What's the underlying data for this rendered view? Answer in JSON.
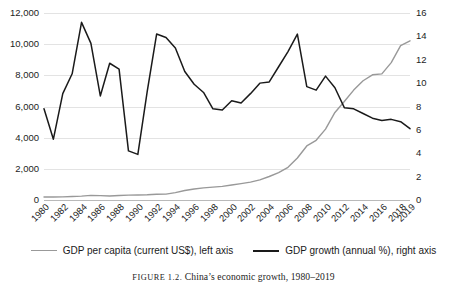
{
  "caption": {
    "prefix": "FIGURE 1.2.",
    "text": "China’s economic growth, 1980–2019"
  },
  "legend": {
    "items": [
      {
        "label": "GDP per capita (current US$), left axis",
        "color": "#999999"
      },
      {
        "label": "GDP growth (annual %), right axis",
        "color": "#1a1a1a"
      }
    ]
  },
  "chart_data": {
    "type": "line",
    "title": "China’s economic growth, 1980–2019",
    "xlabel": "",
    "grid": true,
    "legend_position": "bottom",
    "x": [
      1980,
      1981,
      1982,
      1983,
      1984,
      1985,
      1986,
      1987,
      1988,
      1989,
      1990,
      1991,
      1992,
      1993,
      1994,
      1995,
      1996,
      1997,
      1998,
      1999,
      2000,
      2001,
      2002,
      2003,
      2004,
      2005,
      2006,
      2007,
      2008,
      2009,
      2010,
      2011,
      2012,
      2013,
      2014,
      2015,
      2016,
      2017,
      2018,
      2019
    ],
    "xtick_labels": [
      "1980",
      "1982",
      "1984",
      "1986",
      "1988",
      "1990",
      "1992",
      "1994",
      "1996",
      "1998",
      "2000",
      "2002",
      "2004",
      "2006",
      "2008",
      "2010",
      "2012",
      "2014",
      "2016",
      "2018",
      "2019"
    ],
    "axes": [
      {
        "id": "left",
        "side": "left",
        "label": "GDP per capita (current US$)",
        "ylim": [
          0,
          12000
        ],
        "ticks": [
          0,
          2000,
          4000,
          6000,
          8000,
          10000,
          12000
        ],
        "tick_labels": [
          "0",
          "2,000",
          "4,000",
          "6,000",
          "8,000",
          "10,000",
          "12,000"
        ]
      },
      {
        "id": "right",
        "side": "right",
        "label": "GDP growth (annual %)",
        "ylim": [
          0,
          16
        ],
        "ticks": [
          0,
          2,
          4,
          6,
          8,
          10,
          12,
          14,
          16
        ],
        "tick_labels": [
          "0",
          "2",
          "4",
          "6",
          "8",
          "10",
          "12",
          "14",
          "16"
        ]
      }
    ],
    "series": [
      {
        "name": "GDP per capita (current US$), left axis",
        "axis": "left",
        "color": "#999999",
        "values": [
          195,
          197,
          203,
          225,
          250,
          294,
          282,
          252,
          284,
          311,
          318,
          333,
          366,
          377,
          473,
          610,
          709,
          781,
          828,
          873,
          959,
          1053,
          1149,
          1288,
          1509,
          1753,
          2099,
          2694,
          3468,
          3832,
          4550,
          5618,
          6317,
          7051,
          7651,
          8034,
          8094,
          8817,
          9905,
          10217
        ]
      },
      {
        "name": "GDP growth (annual %), right axis",
        "axis": "right",
        "color": "#1a1a1a",
        "values": [
          7.8,
          5.2,
          9.1,
          10.8,
          15.2,
          13.4,
          8.9,
          11.7,
          11.2,
          4.2,
          3.9,
          9.3,
          14.2,
          13.9,
          13.0,
          11.0,
          9.9,
          9.2,
          7.8,
          7.7,
          8.5,
          8.3,
          9.1,
          10.0,
          10.1,
          11.4,
          12.7,
          14.2,
          9.7,
          9.4,
          10.6,
          9.6,
          7.9,
          7.8,
          7.4,
          7.0,
          6.8,
          6.9,
          6.7,
          6.1
        ]
      }
    ]
  }
}
